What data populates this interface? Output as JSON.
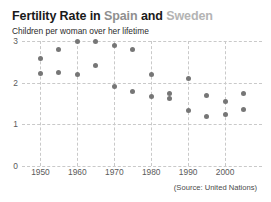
{
  "title": {
    "part1": "Fertility Rate in",
    "spain": "Spain",
    "conj": "and",
    "sweden": "Sweden",
    "spain_color": "#8f8f8f",
    "sweden_color": "#b4b4b4"
  },
  "subtitle": "Children per woman over her lifetime",
  "source": "(Source: United Nations)",
  "chart_data": {
    "type": "scatter",
    "title": "Fertility Rate in Spain and Sweden",
    "subtitle": "Children per woman over her lifetime",
    "xlabel": "",
    "ylabel": "",
    "xlim": [
      1945,
      2010
    ],
    "ylim": [
      0,
      3
    ],
    "yticks": [
      0,
      1,
      2,
      3
    ],
    "ytick_labels": [
      "0",
      "1",
      "2",
      "3"
    ],
    "xticks": [
      1950,
      1960,
      1970,
      1980,
      1990,
      2000
    ],
    "xtick_labels": [
      "1950",
      "1960",
      "1970",
      "1980",
      "1990",
      "2000"
    ],
    "grid": true,
    "legend": "in-title",
    "marker_color": "#767676",
    "series": [
      {
        "name": "Spain",
        "x": [
          1950,
          1955,
          1960,
          1965,
          1970,
          1975,
          1980,
          1985,
          1990,
          1995,
          2000,
          2005
        ],
        "values": [
          2.57,
          2.8,
          3.0,
          3.0,
          2.9,
          2.8,
          2.2,
          1.63,
          1.33,
          1.18,
          1.23,
          1.35
        ]
      },
      {
        "name": "Sweden",
        "x": [
          1950,
          1955,
          1960,
          1965,
          1970,
          1975,
          1980,
          1985,
          1990,
          1995,
          2000,
          2005
        ],
        "values": [
          2.21,
          2.25,
          2.2,
          2.42,
          1.92,
          1.8,
          1.66,
          1.75,
          2.1,
          1.7,
          1.55,
          1.75
        ]
      }
    ],
    "annotation": "(Source: United Nations)"
  },
  "geometry": {
    "plot_left": 22,
    "plot_top": 41,
    "plot_width": 240,
    "plot_height": 125,
    "x_min_year": 1945,
    "x_max_year": 2010,
    "y_min": 0,
    "y_max": 3
  }
}
